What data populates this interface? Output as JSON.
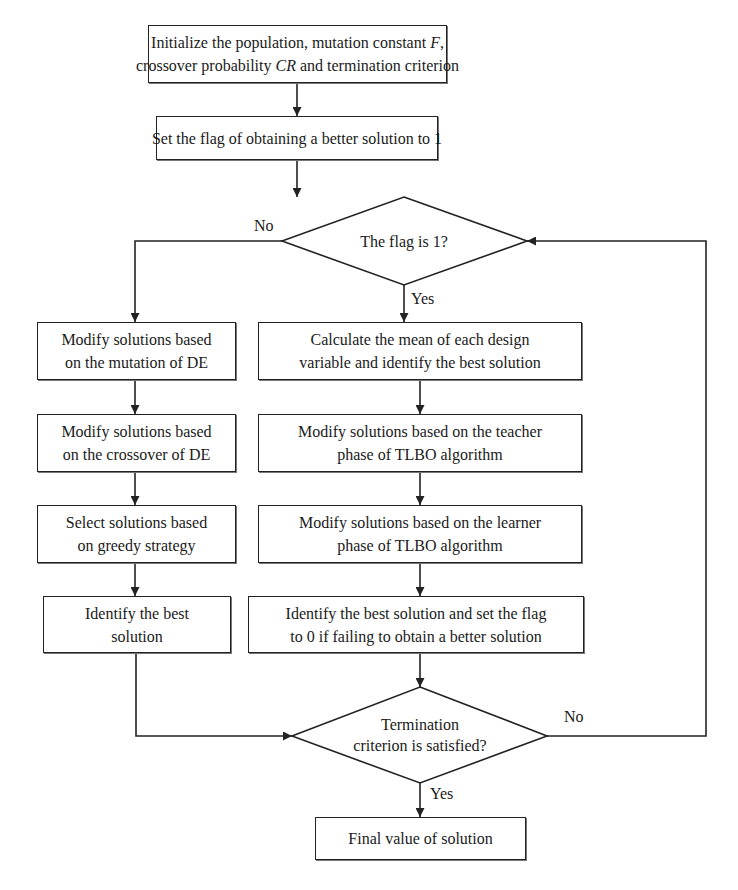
{
  "diagram": {
    "type": "flowchart",
    "nodes": {
      "init": {
        "line1": "Initialize the population, mutation constant F,",
        "line2": "crossover probability CR and termination criterion",
        "line1_pre": "Initialize the population, mutation constant ",
        "line1_var": "F",
        "line1_post": ",",
        "line2_pre": "crossover probability ",
        "line2_var": "CR",
        "line2_post": " and termination criterion"
      },
      "set_flag": {
        "text": "Set the flag of obtaining a better solution to 1"
      },
      "flag_decision": {
        "text": "The flag is 1?"
      },
      "de_mutation": {
        "line1": "Modify solutions based",
        "line2": "on the mutation of DE"
      },
      "de_crossover": {
        "line1": "Modify solutions based",
        "line2": "on the crossover of DE"
      },
      "de_select": {
        "line1": "Select solutions based",
        "line2": "on greedy strategy"
      },
      "de_identify": {
        "line1": "Identify the best",
        "line2": "solution"
      },
      "tlbo_mean": {
        "line1": "Calculate the mean of each design",
        "line2": "variable and identify the best solution"
      },
      "tlbo_teacher": {
        "line1": "Modify solutions based on the teacher",
        "line2": "phase of TLBO algorithm"
      },
      "tlbo_learner": {
        "line1": "Modify solutions based on the learner",
        "line2": "phase of TLBO algorithm"
      },
      "tlbo_identify": {
        "line1": "Identify the best solution and set the flag",
        "line2": "to 0 if failing to obtain a better solution"
      },
      "termination_decision": {
        "line1": "Termination",
        "line2": "criterion is satisfied?"
      },
      "final": {
        "text": "Final value of solution"
      }
    },
    "edge_labels": {
      "flag_no": "No",
      "flag_yes": "Yes",
      "term_no": "No",
      "term_yes": "Yes"
    },
    "edges": [
      [
        "init",
        "set_flag"
      ],
      [
        "set_flag",
        "flag_decision"
      ],
      [
        "flag_decision",
        "tlbo_mean",
        "Yes"
      ],
      [
        "flag_decision",
        "de_mutation",
        "No"
      ],
      [
        "de_mutation",
        "de_crossover"
      ],
      [
        "de_crossover",
        "de_select"
      ],
      [
        "de_select",
        "de_identify"
      ],
      [
        "de_identify",
        "termination_decision"
      ],
      [
        "tlbo_mean",
        "tlbo_teacher"
      ],
      [
        "tlbo_teacher",
        "tlbo_learner"
      ],
      [
        "tlbo_learner",
        "tlbo_identify"
      ],
      [
        "tlbo_identify",
        "termination_decision"
      ],
      [
        "termination_decision",
        "final",
        "Yes"
      ],
      [
        "termination_decision",
        "flag_decision",
        "No"
      ]
    ],
    "colors": {
      "stroke": "#222222",
      "background": "#ffffff",
      "text": "#1a1a1a"
    }
  }
}
